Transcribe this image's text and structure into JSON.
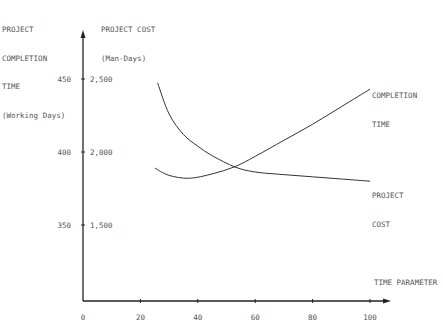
{
  "chart_data": {
    "type": "line",
    "title": "",
    "xlabel": "TIME PARAMETER",
    "ylabel_left": [
      "PROJECT",
      "COMPLETION",
      "TIME",
      "(Working Days)"
    ],
    "ylabel_right": [
      "PROJECT COST",
      "(Man-Days)"
    ],
    "x_ticks": [
      "0",
      "20",
      "40",
      "60",
      "80",
      "100"
    ],
    "y_ticks_left": [
      "450",
      "400",
      "350"
    ],
    "y_ticks_right": [
      "2,500",
      "2,000",
      "1,500"
    ],
    "xlim": [
      0,
      105
    ],
    "ylim_left": [
      300,
      470
    ],
    "ylim_right": [
      1000,
      2700
    ],
    "grid": false,
    "series": [
      {
        "name": "COMPLETION TIME",
        "axis": "left",
        "x": [
          25,
          30,
          37,
          45,
          53,
          60,
          70,
          80,
          90,
          100
        ],
        "values": [
          389,
          384,
          382,
          385,
          390,
          397,
          408,
          419,
          431,
          443
        ]
      },
      {
        "name": "PROJECT COST",
        "axis": "right",
        "x": [
          26,
          30,
          35,
          40,
          45,
          53,
          60,
          70,
          80,
          90,
          100
        ],
        "values": [
          2473,
          2260,
          2120,
          2040,
          1975,
          1897,
          1863,
          1845,
          1830,
          1815,
          1800
        ]
      }
    ],
    "annotations": [
      "COMPLETION TIME",
      "PROJECT COST"
    ]
  },
  "labels": {
    "left_axis": [
      "PROJECT",
      "COMPLETION",
      "TIME",
      "(Working Days)"
    ],
    "right_axis": [
      "PROJECT COST",
      "(Man-Days)"
    ],
    "x_axis": "TIME PARAMETER",
    "series1_label": [
      "COMPLETION",
      "TIME"
    ],
    "series2_label": [
      "PROJECT",
      "COST"
    ]
  }
}
